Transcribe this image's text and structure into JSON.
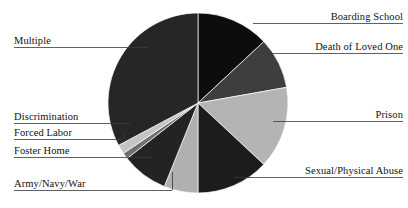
{
  "chart_data": {
    "type": "pie",
    "title": "",
    "subtitle": "",
    "xlabel": "",
    "ylabel": "",
    "legend_position": "none",
    "grid": false,
    "labels_placement": "outside-with-leader-lines",
    "start_angle_deg": 0,
    "direction": "clockwise",
    "categories": [
      "Boarding School",
      "Death of Loved One",
      "Prison",
      "Sexual/Physical Abuse",
      "Army/Navy/War",
      "Foster Home",
      "Forced Labor",
      "Discrimination",
      "Multiple"
    ],
    "values": [
      13.1,
      9.2,
      14.7,
      13.1,
      6.1,
      8.3,
      1.1,
      1.7,
      32.7
    ],
    "slices": [
      {
        "label": "Boarding School",
        "value": 13.1,
        "start_deg": 0.0,
        "end_deg": 47.0,
        "color": "#0d0d0d"
      },
      {
        "label": "Death of Loved One",
        "value": 9.2,
        "start_deg": 47.0,
        "end_deg": 80.0,
        "color": "#3e3e3e"
      },
      {
        "label": "Prison",
        "value": 14.7,
        "start_deg": 80.0,
        "end_deg": 133.0,
        "color": "#b4b4b4"
      },
      {
        "label": "Sexual/Physical Abuse",
        "value": 13.1,
        "start_deg": 133.0,
        "end_deg": 180.0,
        "color": "#1c1c1c"
      },
      {
        "label": "Army/Navy/War",
        "value": 6.1,
        "start_deg": 180.0,
        "end_deg": 202.0,
        "color": "#b0b0b0"
      },
      {
        "label": "Foster Home",
        "value": 8.3,
        "start_deg": 202.0,
        "end_deg": 232.0,
        "color": "#232323"
      },
      {
        "label": "Forced Labor",
        "value": 1.1,
        "start_deg": 232.0,
        "end_deg": 236.0,
        "color": "#707070"
      },
      {
        "label": "Discrimination",
        "value": 1.7,
        "start_deg": 236.0,
        "end_deg": 242.0,
        "color": "#c4c4c4"
      },
      {
        "label": "Multiple",
        "value": 32.7,
        "start_deg": 242.0,
        "end_deg": 360.0,
        "color": "#262626"
      }
    ],
    "geometry": {
      "center_x": 198,
      "center_y": 103,
      "radius": 90
    }
  },
  "labels": {
    "boarding_school": "Boarding School",
    "death_of_loved_one": "Death of Loved One",
    "prison": "Prison",
    "sexual_physical_abuse": "Sexual/Physical Abuse",
    "army_navy_war": "Army/Navy/War",
    "foster_home": "Foster Home",
    "forced_labor": "Forced Labor",
    "discrimination": "Discrimination",
    "multiple": "Multiple"
  },
  "colors": {
    "background": "#ffffff",
    "text": "#111111",
    "leader_line": "#3a3a3a",
    "slice_boarding_school": "#0d0d0d",
    "slice_death_of_loved_one": "#3e3e3e",
    "slice_prison": "#b4b4b4",
    "slice_sexual_physical_abuse": "#1c1c1c",
    "slice_army_navy_war": "#b0b0b0",
    "slice_foster_home": "#232323",
    "slice_forced_labor": "#707070",
    "slice_discrimination": "#c4c4c4",
    "slice_multiple": "#262626"
  }
}
